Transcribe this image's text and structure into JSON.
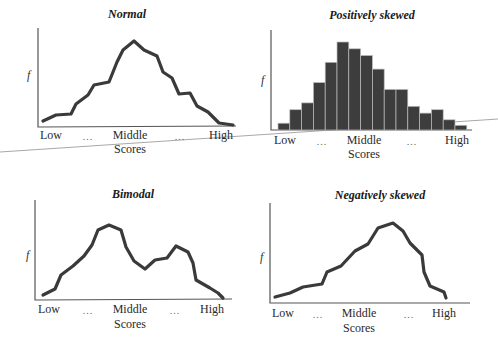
{
  "chart_data": [
    {
      "type": "line",
      "title": "Normal",
      "xlabel": "Scores",
      "ylabel": "f",
      "x_tick_labels": [
        "Low",
        "...",
        "Middle",
        "...",
        "High"
      ],
      "grid": false,
      "legend": null,
      "y": [
        1,
        2,
        2,
        4,
        5,
        7,
        7,
        10,
        12,
        13,
        11,
        10,
        8,
        7,
        5,
        5,
        3,
        2,
        0.5,
        0.3
      ],
      "points_px": [
        [
          43,
          121
        ],
        [
          56,
          115
        ],
        [
          71,
          114
        ],
        [
          76,
          104
        ],
        [
          88,
          95
        ],
        [
          94,
          85
        ],
        [
          109,
          82
        ],
        [
          117,
          62
        ],
        [
          123,
          50
        ],
        [
          134,
          41
        ],
        [
          144,
          50
        ],
        [
          157,
          56
        ],
        [
          163,
          72
        ],
        [
          172,
          78
        ],
        [
          179,
          94
        ],
        [
          190,
          93
        ],
        [
          197,
          106
        ],
        [
          208,
          112
        ],
        [
          219,
          123
        ],
        [
          233,
          125
        ]
      ]
    },
    {
      "type": "bar",
      "title": "Positively skewed",
      "xlabel": "Scores",
      "ylabel": "f",
      "x_tick_labels": [
        "Low",
        "...",
        "Middle",
        "...",
        "High"
      ],
      "grid": false,
      "legend": null,
      "values": [
        1,
        3,
        4,
        7,
        10,
        13,
        12,
        11,
        9,
        6,
        6,
        3.5,
        2.5,
        3,
        1.5,
        0.7
      ],
      "bar_color": "#3d3d3d"
    },
    {
      "type": "line",
      "title": "Bimodal",
      "xlabel": "Scores",
      "ylabel": "f",
      "x_tick_labels": [
        "Low",
        "...",
        "Middle",
        "...",
        "High"
      ],
      "grid": false,
      "legend": null,
      "y": [
        1,
        2,
        5,
        6.5,
        8,
        9.5,
        12.5,
        13,
        12.5,
        9,
        7.5,
        6.5,
        7.5,
        8,
        10,
        9.5,
        7.5,
        4,
        3,
        1.5,
        0.3
      ],
      "points_px": [
        [
          43,
          295
        ],
        [
          55,
          289
        ],
        [
          61,
          275
        ],
        [
          73,
          266
        ],
        [
          84,
          256
        ],
        [
          92,
          245
        ],
        [
          98,
          230
        ],
        [
          109,
          225
        ],
        [
          121,
          230
        ],
        [
          126,
          247
        ],
        [
          134,
          261
        ],
        [
          145,
          269
        ],
        [
          155,
          260
        ],
        [
          167,
          258
        ],
        [
          176,
          246
        ],
        [
          188,
          252
        ],
        [
          193,
          263
        ],
        [
          196,
          280
        ],
        [
          210,
          288
        ],
        [
          218,
          293
        ],
        [
          223,
          298
        ]
      ]
    },
    {
      "type": "line",
      "title": "Negatively skewed",
      "xlabel": "Scores",
      "ylabel": "f",
      "x_tick_labels": [
        "Low",
        "...",
        "Middle",
        "...",
        "High"
      ],
      "grid": false,
      "legend": null,
      "y": [
        0.5,
        1,
        2,
        2.5,
        4.5,
        5.5,
        7.5,
        8.5,
        11,
        11.5,
        10.5,
        8,
        7,
        3,
        2,
        1.5,
        0
      ],
      "points_px": [
        [
          275,
          297
        ],
        [
          290,
          293
        ],
        [
          303,
          287
        ],
        [
          322,
          284
        ],
        [
          327,
          272
        ],
        [
          341,
          266
        ],
        [
          355,
          251
        ],
        [
          368,
          244
        ],
        [
          378,
          228
        ],
        [
          393,
          223
        ],
        [
          403,
          231
        ],
        [
          410,
          243
        ],
        [
          422,
          255
        ],
        [
          424,
          272
        ],
        [
          430,
          286
        ],
        [
          444,
          292
        ],
        [
          446,
          298
        ]
      ]
    }
  ],
  "panels": [
    {
      "title": "Normal",
      "ylabel": "f",
      "low": "Low",
      "dots1": "...",
      "middle": "Middle",
      "dots2": "...",
      "high": "High",
      "scores": "Scores"
    },
    {
      "title": "Positively skewed",
      "ylabel": "f",
      "low": "Low",
      "dots1": "...",
      "middle": "Middle",
      "dots2": "...",
      "high": "High",
      "scores": "Scores"
    },
    {
      "title": "Bimodal",
      "ylabel": "f",
      "low": "Low",
      "dots1": "...",
      "middle": "Middle",
      "dots2": "...",
      "high": "High",
      "scores": "Scores"
    },
    {
      "title": "Negatively skewed",
      "ylabel": "f",
      "low": "Low",
      "dots1": "...",
      "middle": "Middle",
      "dots2": "...",
      "high": "High",
      "scores": "Scores"
    }
  ],
  "colors": {
    "line": "#3a3a3a",
    "bar_fill": "#3d3d3d",
    "bar_edge": "#bdbdbd",
    "axis": "#555555",
    "crease": "#9a9a9a"
  }
}
